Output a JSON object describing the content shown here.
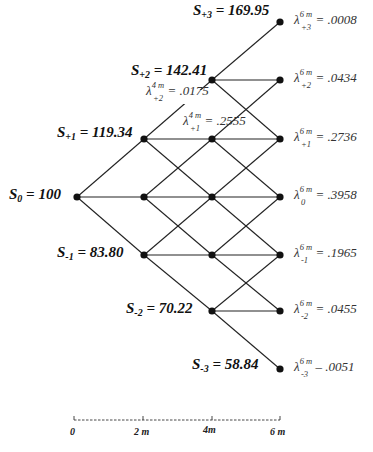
{
  "diagram": {
    "type": "trinomial-tree",
    "axis": {
      "ticks": [
        "0",
        "2 m",
        "4m",
        "6 m"
      ]
    },
    "stock_prices": [
      {
        "id": "s_p3",
        "sym": "S",
        "sub": "+3",
        "eq": "= 169.95"
      },
      {
        "id": "s_p2",
        "sym": "S",
        "sub": "+2",
        "eq": "= 142.41"
      },
      {
        "id": "s_p1",
        "sym": "S",
        "sub": "+1",
        "eq": "= 119.34"
      },
      {
        "id": "s_0",
        "sym": "S",
        "sub": "0",
        "eq": "= 100"
      },
      {
        "id": "s_m1",
        "sym": "S",
        "sub": "-1",
        "eq": "= 83.80"
      },
      {
        "id": "s_m2",
        "sym": "S",
        "sub": "-2",
        "eq": "= 70.22"
      },
      {
        "id": "s_m3",
        "sym": "S",
        "sub": "-3",
        "eq": "= 58.84"
      }
    ],
    "arrow_debreu_4m": [
      {
        "sup": "4 m",
        "sub": "+2",
        "eq": "= .0175"
      },
      {
        "sup": "4 m",
        "sub": "+1",
        "eq": "= .2555"
      }
    ],
    "arrow_debreu_6m": [
      {
        "sup": "6 m",
        "sub": "+3",
        "eq": "= .0008"
      },
      {
        "sup": "6 m",
        "sub": "+2",
        "eq": "= .0434"
      },
      {
        "sup": "6 m",
        "sub": "+1",
        "eq": "= .2736"
      },
      {
        "sup": "6 m",
        "sub": "0",
        "eq": "= .3958"
      },
      {
        "sup": "6 m",
        "sub": "-1",
        "eq": "= .1965"
      },
      {
        "sup": "6 m",
        "sub": "-2",
        "eq": "= .0455"
      },
      {
        "sup": "6 m",
        "sub": "-3",
        "eq": "– .0051"
      }
    ],
    "lambda_symbol": "λ"
  }
}
